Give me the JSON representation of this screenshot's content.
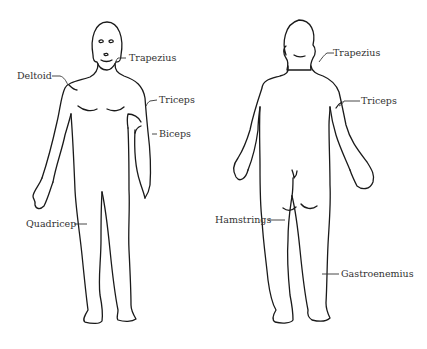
{
  "diagram": {
    "figures": [
      {
        "id": "front",
        "view": "anterior",
        "labels": [
          {
            "key": "deltoid",
            "text": "Deltoid"
          },
          {
            "key": "trapezius",
            "text": "Trapezius"
          },
          {
            "key": "triceps",
            "text": "Triceps"
          },
          {
            "key": "biceps",
            "text": "Biceps"
          },
          {
            "key": "quadricep",
            "text": "Quadricep"
          }
        ]
      },
      {
        "id": "back",
        "view": "posterior",
        "labels": [
          {
            "key": "trapezius",
            "text": "Trapezius"
          },
          {
            "key": "triceps",
            "text": "Triceps"
          },
          {
            "key": "hamstrings",
            "text": "Hamstrings"
          },
          {
            "key": "gastrocnemius",
            "text": "Gastroenemius"
          }
        ]
      }
    ],
    "colors": {
      "outline": "#1a1a1a",
      "label_text": "#333333",
      "background": "#ffffff"
    }
  }
}
